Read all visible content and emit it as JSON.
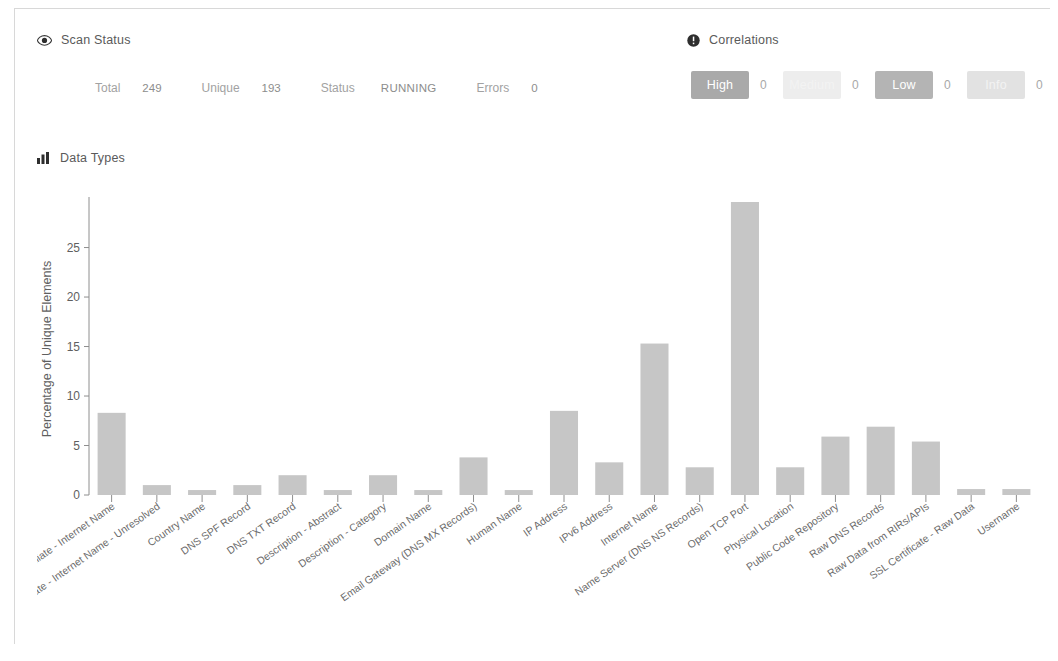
{
  "scan_status": {
    "title": "Scan Status",
    "icon": "eye-icon",
    "stats": [
      {
        "label": "Total",
        "value": "249"
      },
      {
        "label": "Unique",
        "value": "193"
      },
      {
        "label": "Status",
        "value": "RUNNING"
      },
      {
        "label": "Errors",
        "value": "0"
      }
    ]
  },
  "correlations": {
    "title": "Correlations",
    "icon": "exclamation-circle-icon",
    "items": [
      {
        "label": "High",
        "count": "0",
        "color": "#a9a9a9"
      },
      {
        "label": "Medium",
        "count": "0",
        "color": "#ededed"
      },
      {
        "label": "Low",
        "count": "0",
        "color": "#b4b4b4"
      },
      {
        "label": "Info",
        "count": "0",
        "color": "#e2e2e2"
      }
    ]
  },
  "data_types": {
    "title": "Data Types",
    "icon": "bar-chart-icon"
  },
  "chart_data": {
    "type": "bar",
    "title": "Data Types",
    "xlabel": "",
    "ylabel": "Percentage of Unique Elements",
    "ylim": [
      0,
      29.5
    ],
    "yticks": [
      0,
      5,
      10,
      15,
      20,
      25
    ],
    "grid": false,
    "legend": false,
    "bar_color": "#c6c6c6",
    "categories": [
      "Affiliate - Internet Name",
      "Affiliate - Internet Name - Unresolved",
      "Country Name",
      "DNS SPF Record",
      "DNS TXT Record",
      "Description - Abstract",
      "Description - Category",
      "Domain Name",
      "Email Gateway (DNS MX Records)",
      "Human Name",
      "IP Address",
      "IPv6 Address",
      "Internet Name",
      "Name Server (DNS NS Records)",
      "Open TCP Port",
      "Physical Location",
      "Public Code Repository",
      "Raw DNS Records",
      "Raw Data from RIRs/APIs",
      "SSL Certificate - Raw Data",
      "Username"
    ],
    "values": [
      8.3,
      1.0,
      0.5,
      1.0,
      2.0,
      0.5,
      2.0,
      0.5,
      3.8,
      0.5,
      8.5,
      3.3,
      15.3,
      2.8,
      29.6,
      2.8,
      5.9,
      6.9,
      5.4,
      0.6,
      0.6
    ]
  }
}
